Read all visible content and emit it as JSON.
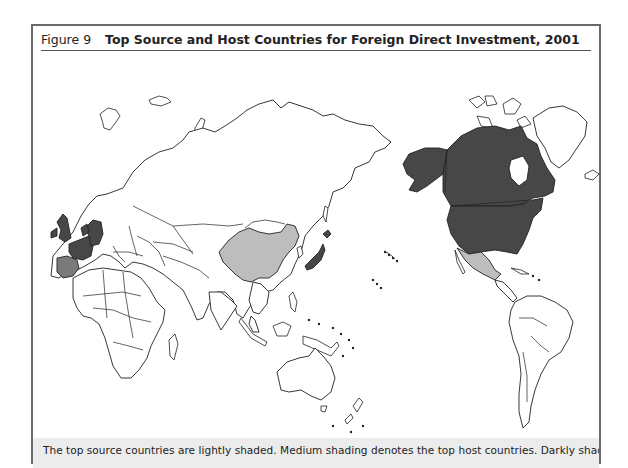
{
  "figure": {
    "label": "Figure 9",
    "title": "Top Source and Host Countries for Foreign Direct Investment, 2001"
  },
  "caption": "The top source countries are lightly shaded. Medium shading denotes the top host countries. Darkly shaded countries",
  "legend": {
    "light": {
      "meaning": "Top source countries",
      "color": "#bdbdbd"
    },
    "medium": {
      "meaning": "Top host countries",
      "color": "#7a7a7a"
    },
    "dark": {
      "meaning": "Darkly shaded countries",
      "color": "#474747"
    }
  },
  "map": {
    "projection": "Pacific-centered world map",
    "shaded_regions": [
      {
        "name": "United States",
        "shade": "dark"
      },
      {
        "name": "Canada",
        "shade": "dark"
      },
      {
        "name": "United Kingdom",
        "shade": "dark"
      },
      {
        "name": "France",
        "shade": "dark"
      },
      {
        "name": "Germany",
        "shade": "dark"
      },
      {
        "name": "Netherlands",
        "shade": "dark"
      },
      {
        "name": "Japan",
        "shade": "dark"
      },
      {
        "name": "Spain",
        "shade": "medium"
      },
      {
        "name": "China",
        "shade": "light"
      },
      {
        "name": "Mexico",
        "shade": "light"
      }
    ]
  }
}
